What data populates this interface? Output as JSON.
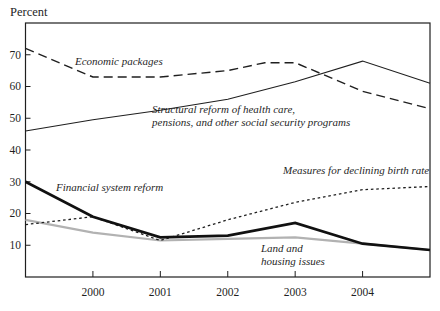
{
  "chart_data": {
    "type": "line",
    "title": "",
    "ylabel": "Percent",
    "xlabel": "",
    "xlim": [
      1999,
      2005
    ],
    "ylim": [
      0,
      80
    ],
    "x_ticks": [
      2000,
      2001,
      2002,
      2003,
      2004
    ],
    "y_ticks": [
      10,
      20,
      30,
      40,
      50,
      60,
      70
    ],
    "grid": false,
    "frame": true,
    "legend_position": "inline-annotations",
    "axis_color": "#1f1f1f",
    "series": [
      {
        "name": "Land and housing issues",
        "style": "solid",
        "color": "#b2b2b2",
        "width": 2.2,
        "points": [
          [
            1999,
            18
          ],
          [
            2000,
            14
          ],
          [
            2001,
            11.5
          ],
          [
            2002,
            12
          ],
          [
            2003,
            12.5
          ],
          [
            2004,
            10.5
          ],
          [
            2005,
            8.5
          ]
        ]
      },
      {
        "name": "Economic packages",
        "style": "long-dash",
        "color": "#1f1f1f",
        "width": 1.4,
        "points": [
          [
            1999,
            72
          ],
          [
            2000,
            63
          ],
          [
            2001,
            63
          ],
          [
            2002,
            65
          ],
          [
            2002.55,
            67.5
          ],
          [
            2003,
            67.5
          ],
          [
            2004,
            58.5
          ],
          [
            2005,
            53
          ]
        ]
      },
      {
        "name": "Structural reform of health care, pensions, and other social security programs",
        "style": "solid",
        "color": "#1f1f1f",
        "width": 1.1,
        "points": [
          [
            1999,
            46
          ],
          [
            2000,
            49.5
          ],
          [
            2001,
            52.5
          ],
          [
            2002,
            56
          ],
          [
            2003,
            61.5
          ],
          [
            2004,
            68
          ],
          [
            2005,
            61
          ]
        ]
      },
      {
        "name": "Measures for declining birth rate",
        "style": "short-dash",
        "color": "#1f1f1f",
        "width": 1.3,
        "points": [
          [
            1999,
            16.5
          ],
          [
            2000,
            19
          ],
          [
            2001,
            11.5
          ],
          [
            2002,
            18
          ],
          [
            2003,
            23.5
          ],
          [
            2004,
            27.5
          ],
          [
            2005,
            28.5
          ]
        ]
      },
      {
        "name": "Financial system reform",
        "style": "solid",
        "color": "#111111",
        "width": 2.7,
        "points": [
          [
            1999,
            30
          ],
          [
            2000,
            19
          ],
          [
            2001,
            12.5
          ],
          [
            2002,
            13
          ],
          [
            2003,
            17
          ],
          [
            2004,
            10.5
          ],
          [
            2005,
            8.5
          ]
        ]
      }
    ],
    "annotations": [
      {
        "text": "Economic packages",
        "x": 75,
        "y": 55
      },
      {
        "text": "Structural reform of health care,\npensions, and other social security programs",
        "x": 152,
        "y": 103
      },
      {
        "text": "Financial system reform",
        "x": 56,
        "y": 181
      },
      {
        "text": "Measures for declining birth rate",
        "x": 283,
        "y": 164
      },
      {
        "text": "Land and\nhousing issues",
        "x": 261,
        "y": 242
      }
    ]
  }
}
